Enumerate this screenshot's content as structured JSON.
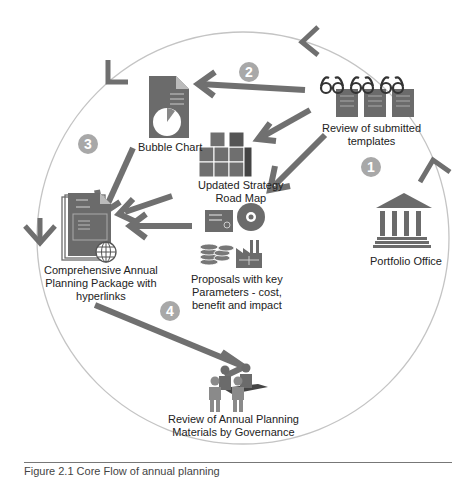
{
  "colors": {
    "icon": "#6b6b6b",
    "icon_dark": "#555555",
    "arrow": "#707070",
    "circle": "#bdbdbd",
    "step_badge": "#a6a6a6",
    "text": "#222222"
  },
  "nodes": {
    "review_templates": {
      "label_line1": "Review of submitted",
      "label_line2": "templates",
      "icon": "binoculars-documents-icon"
    },
    "bubble_chart": {
      "label": "Bubble Chart",
      "icon": "pie-chart-document-icon"
    },
    "road_map": {
      "label_line1": "Updated Strategy",
      "label_line2": "Road Map",
      "icon": "stacked-blocks-icon"
    },
    "proposals": {
      "label_line1": "Proposals with key",
      "label_line2": "Parameters - cost,",
      "label_line3": "benefit and impact",
      "icon": "certificate-disc-coins-factory-icon"
    },
    "package": {
      "label_line1": "Comprehensive Annual",
      "label_line2": "Planning Package with",
      "label_line3": "hyperlinks",
      "icon": "documents-globe-icon"
    },
    "portfolio_office": {
      "label": "Portfolio Office",
      "icon": "building-columns-icon"
    },
    "governance": {
      "label_line1": "Review of Annual Planning",
      "label_line2": "Materials by Governance",
      "icon": "people-meeting-icon"
    }
  },
  "steps": [
    "1",
    "2",
    "3",
    "4"
  ],
  "caption": "Figure 2.1  Core Flow of annual planning"
}
